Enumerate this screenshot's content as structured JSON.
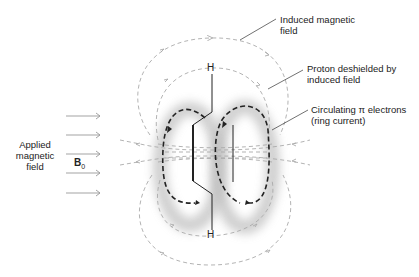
{
  "labels": {
    "induced_field": [
      "Induced magnetic",
      "field"
    ],
    "proton_deshielded": [
      "Proton deshielded by",
      "induced field"
    ],
    "ring_current": [
      "Circulating π electrons",
      "(ring current)"
    ],
    "applied_field": [
      "Applied",
      "magnetic",
      "field"
    ],
    "b0_symbol": "B",
    "b0_subscript": "0",
    "hydrogen_top": "H",
    "hydrogen_bottom": "H"
  },
  "colors": {
    "field_lines": "#aaaaaa",
    "ring_current": "#222222",
    "bonds": "#222222",
    "glow": "#bbbbbb"
  }
}
